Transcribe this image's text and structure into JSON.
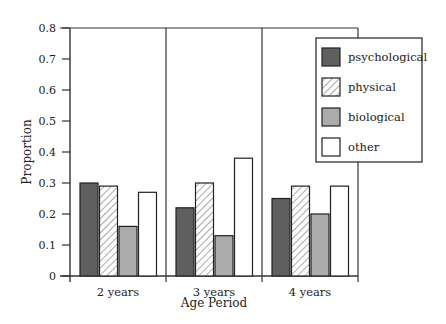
{
  "chart_data": {
    "type": "bar",
    "title": "",
    "xlabel": "Age Period",
    "ylabel": "Proportion",
    "ylim": [
      0,
      0.8
    ],
    "yticks": [
      "0",
      "0.1",
      "0.2",
      "0.3",
      "0.4",
      "0.5",
      "0.6",
      "0.7",
      "0.8"
    ],
    "categories": [
      "2 years",
      "3 years",
      "4 years"
    ],
    "series": [
      {
        "name": "psychological",
        "values": [
          0.3,
          0.22,
          0.25
        ],
        "fill": "#5f5f5f",
        "pattern": "solid"
      },
      {
        "name": "physical",
        "values": [
          0.29,
          0.3,
          0.29
        ],
        "fill": "#ffffff",
        "pattern": "hatch"
      },
      {
        "name": "biological",
        "values": [
          0.16,
          0.13,
          0.2
        ],
        "fill": "#ababab",
        "pattern": "solid"
      },
      {
        "name": "other",
        "values": [
          0.27,
          0.38,
          0.29
        ],
        "fill": "#ffffff",
        "pattern": "solid"
      }
    ],
    "grid": false,
    "legend_position": "upper right (inside)",
    "group_dividers": true
  }
}
